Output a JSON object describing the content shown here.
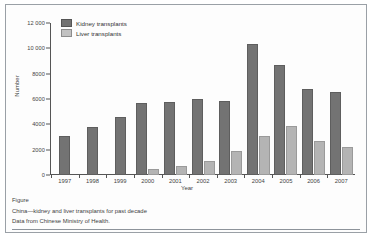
{
  "figure": {
    "caption_label": "Figure",
    "caption_title": "China—kidney and liver transplants for past decade",
    "caption_source": "Data from Chinese Ministry of Health."
  },
  "legend": {
    "position": "top-left-inside",
    "entries": [
      {
        "label": "Kidney transplants",
        "color": "#737373"
      },
      {
        "label": "Liver transplants",
        "color": "#c2c2c2"
      }
    ]
  },
  "chart_data": {
    "type": "bar",
    "title": "",
    "xlabel": "Year",
    "ylabel": "Number",
    "ylim": [
      0,
      12000
    ],
    "yticks": [
      "0",
      "2000",
      "4000",
      "6000",
      "8000",
      "10 000",
      "12 000"
    ],
    "ytick_values": [
      0,
      2000,
      4000,
      6000,
      8000,
      10000,
      12000
    ],
    "grid": false,
    "categories": [
      "1997",
      "1998",
      "1999",
      "2000",
      "2001",
      "2002",
      "2003",
      "2004",
      "2005",
      "2006",
      "2007"
    ],
    "series": [
      {
        "name": "Kidney transplants",
        "color": "#737373",
        "values": [
          2900,
          3600,
          4400,
          5550,
          5600,
          5850,
          5700,
          10200,
          8500,
          6600,
          6400
        ]
      },
      {
        "name": "Liver transplants",
        "color": "#b4b4b4",
        "values": [
          0,
          0,
          0,
          300,
          550,
          950,
          1700,
          2900,
          3700,
          2500,
          2050
        ]
      }
    ]
  }
}
